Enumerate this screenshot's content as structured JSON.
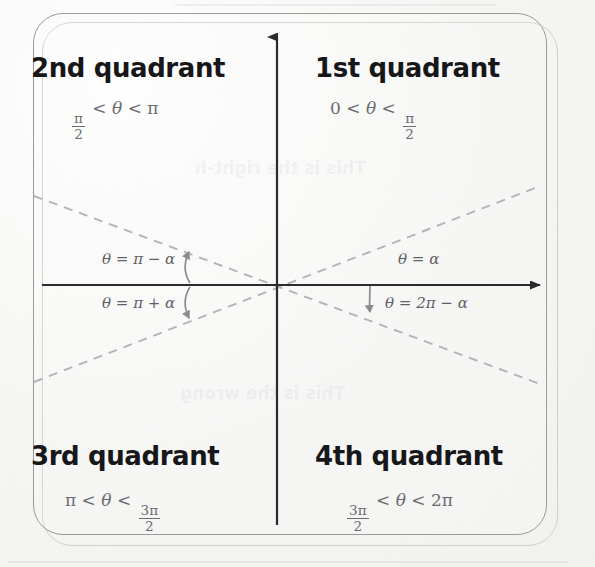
{
  "figure": {
    "type": "diagram",
    "background_color": "#f7f7f5",
    "frame": {
      "shape": "rounded-rectangle",
      "border_color": "#9a9a98",
      "has_drop_shadow": true
    },
    "axes": {
      "x_axis": {
        "color": "#2b2b2e",
        "arrow": "right"
      },
      "y_axis": {
        "color": "#2b2b2e",
        "arrow": "up"
      },
      "origin_label": ""
    },
    "dashed_lines": {
      "color": "#b4b4b8",
      "style": "dashed",
      "count": 2,
      "description": "two terminal-side rays through the origin at angle alpha"
    }
  },
  "quadrants": [
    {
      "id": "q2",
      "title": "2nd quadrant",
      "inequality": {
        "left": "π",
        "left_den": "2",
        "theta": "θ",
        "right": "π"
      },
      "range_text": "π/2 < θ < π"
    },
    {
      "id": "q1",
      "title": "1st quadrant",
      "inequality": {
        "left": "0",
        "theta": "θ",
        "right": "π",
        "right_den": "2"
      },
      "range_text": "0 < θ < π/2"
    },
    {
      "id": "q3",
      "title": "3rd quadrant",
      "inequality": {
        "left": "π",
        "theta": "θ",
        "right": "3π",
        "right_den": "2"
      },
      "range_text": "π < θ < 3π/2"
    },
    {
      "id": "q4",
      "title": "4th quadrant",
      "inequality": {
        "left": "3π",
        "left_den": "2",
        "theta": "θ",
        "right": "2π"
      },
      "range_text": "3π/2 < θ < 2π"
    }
  ],
  "angle_labels": [
    {
      "id": "label-q2",
      "text": "θ = π − α",
      "position": "upper-left"
    },
    {
      "id": "label-q1",
      "text": "θ = α",
      "position": "upper-right"
    },
    {
      "id": "label-q3",
      "text": "θ = π + α",
      "position": "lower-left"
    },
    {
      "id": "label-q4",
      "text": "θ = 2π − α",
      "position": "lower-right"
    }
  ],
  "symbols": {
    "theta": "θ",
    "alpha": "α",
    "pi": "π",
    "less_than": "<",
    "equals": "=",
    "minus": "−",
    "plus": "+"
  },
  "annotation_arrows": [
    {
      "id": "arrow-left",
      "kind": "double-headed-curved",
      "note": "spans from upper dashed ray to lower dashed ray on the left"
    },
    {
      "id": "arrow-right",
      "kind": "single-headed-curved",
      "note": "from x-axis down to lower-right dashed ray"
    }
  ],
  "ghost_text": [
    {
      "text": "This is the right-h",
      "position": "upper-middle"
    },
    {
      "text": "This is the wrong",
      "position": "lower-middle"
    }
  ]
}
